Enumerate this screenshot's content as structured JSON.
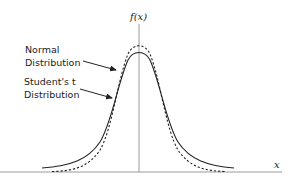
{
  "diagram": {
    "y_axis_label": "f(x)",
    "x_axis_label": "x",
    "annotations": [
      {
        "line1": "Normal",
        "line2": "Distribution",
        "target": "dashed-curve"
      },
      {
        "line1": "Student's t",
        "line2": "Distribution",
        "target": "solid-curve"
      }
    ],
    "curves": [
      {
        "name": "Normal Distribution",
        "style": "dashed",
        "color": "#222222"
      },
      {
        "name": "Student's t Distribution",
        "style": "solid",
        "color": "#222222"
      }
    ],
    "axis_color": "#9a9a9a"
  }
}
